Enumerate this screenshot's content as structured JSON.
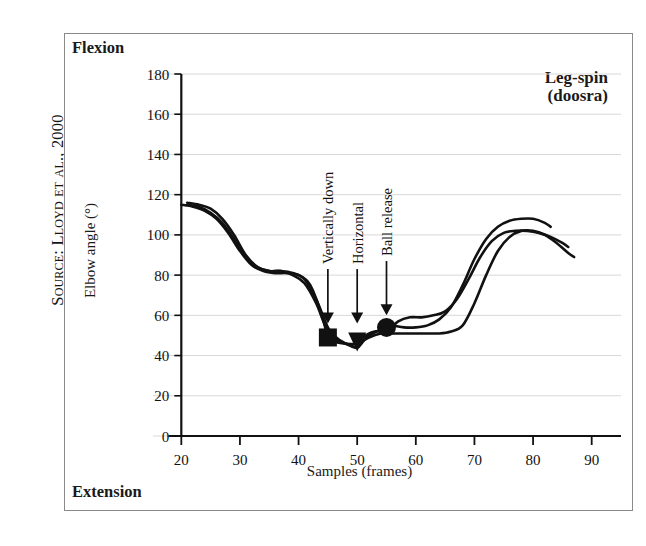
{
  "source_credit": "Source: Lloyd et al., 2000",
  "figure": {
    "title_line1": "Leg-spin",
    "title_line2": "(doosra)",
    "top_corner_label": "Flexion",
    "bottom_corner_label": "Extension"
  },
  "chart_data": {
    "type": "line",
    "title": "Leg-spin (doosra)",
    "xlabel": "Samples (frames)",
    "ylabel": "Elbow angle (°)",
    "xlim": [
      15,
      95
    ],
    "ylim": [
      0,
      180
    ],
    "xticks": [
      20,
      30,
      40,
      50,
      60,
      70,
      80,
      90
    ],
    "yticks": [
      0,
      20,
      40,
      60,
      80,
      100,
      120,
      140,
      160,
      180
    ],
    "xticklabels": [
      "20",
      "30",
      "40",
      "50",
      "60",
      "70",
      "80",
      "90"
    ],
    "yticklabels": [
      "0",
      "20",
      "40",
      "60",
      "80",
      "100",
      "120",
      "140",
      "160",
      "180"
    ],
    "grid": "horizontal",
    "legend": "none",
    "axis_direction_note": {
      "top": "Flexion",
      "bottom": "Extension"
    },
    "series": [
      {
        "name": "trial-1",
        "x": [
          20,
          22,
          24,
          26,
          28,
          30,
          32,
          34,
          36,
          38,
          40,
          42,
          44,
          45,
          46,
          48,
          50,
          52,
          54,
          55,
          56,
          58,
          60,
          62,
          64,
          66,
          68,
          70,
          72,
          74,
          76,
          78,
          80,
          82,
          84,
          86,
          87
        ],
        "y": [
          115,
          114,
          112,
          108,
          101,
          92,
          85,
          82,
          81,
          81,
          80,
          75,
          60,
          49,
          47,
          46,
          46,
          49,
          51,
          51,
          51,
          51,
          51,
          51,
          51,
          52,
          55,
          66,
          80,
          92,
          99,
          102,
          102,
          100,
          96,
          91,
          89
        ]
      },
      {
        "name": "trial-2",
        "x": [
          21,
          23,
          25,
          27,
          29,
          31,
          33,
          35,
          37,
          39,
          41,
          43,
          45,
          46,
          48,
          50,
          51,
          52,
          54,
          55,
          56,
          58,
          60,
          62,
          64,
          66,
          68,
          70,
          72,
          74,
          76,
          78,
          80,
          82,
          83
        ],
        "y": [
          116,
          115,
          113,
          108,
          100,
          90,
          84,
          82,
          82,
          81,
          78,
          68,
          54,
          50,
          46,
          44,
          47,
          50,
          53,
          55,
          55,
          54,
          54,
          55,
          58,
          64,
          75,
          88,
          98,
          104,
          107,
          108,
          108,
          106,
          104
        ]
      },
      {
        "name": "trial-3",
        "x": [
          21,
          23,
          25,
          27,
          29,
          31,
          33,
          35,
          37,
          39,
          41,
          43,
          45,
          47,
          49,
          50,
          51,
          53,
          55,
          57,
          59,
          61,
          63,
          65,
          67,
          69,
          71,
          73,
          75,
          77,
          79,
          81,
          83,
          85,
          86
        ],
        "y": [
          115,
          114,
          111,
          106,
          98,
          89,
          84,
          82,
          82,
          80,
          76,
          66,
          52,
          47,
          45,
          44,
          49,
          52,
          52,
          57,
          59,
          59,
          60,
          62,
          68,
          78,
          89,
          97,
          101,
          102,
          102,
          101,
          99,
          96,
          94
        ]
      }
    ],
    "markers": [
      {
        "label": "Vertically down",
        "shape": "square",
        "x": 45,
        "y": 49
      },
      {
        "label": "Horizontal",
        "shape": "triangle",
        "x": 50,
        "y": 47
      },
      {
        "label": "Ball release",
        "shape": "circle",
        "x": 55,
        "y": 54
      }
    ],
    "annotations": [
      {
        "text": "Vertically down",
        "arrow_x": 45,
        "arrow_tip_y": 56,
        "rotation": -90
      },
      {
        "text": "Horizontal",
        "arrow_x": 50,
        "arrow_tip_y": 56,
        "rotation": -90
      },
      {
        "text": "Ball release",
        "arrow_x": 55,
        "arrow_tip_y": 60,
        "rotation": -90
      }
    ],
    "colors": {
      "line": "#111111",
      "grid": "#d8d8d8",
      "axis": "#111111",
      "frame": "#8a8a8a"
    }
  }
}
